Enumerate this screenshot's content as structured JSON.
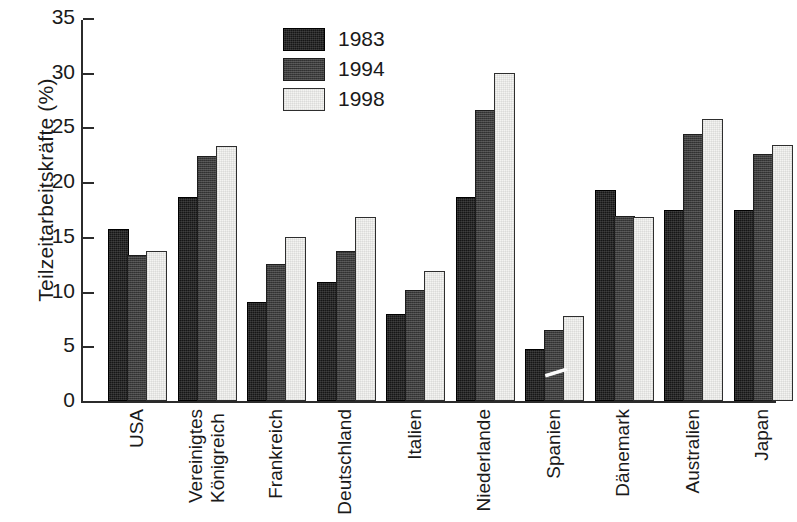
{
  "chart_data": {
    "type": "bar",
    "title": "",
    "xlabel": "",
    "ylabel": "Teilzeitarbeitskräfte (%)",
    "ylim": [
      0,
      35
    ],
    "yticks": [
      0,
      5,
      10,
      15,
      20,
      25,
      30,
      35
    ],
    "grid": false,
    "legend_position": "top-center",
    "categories": [
      "USA",
      "Vereinigtes Königreich",
      "Frankreich",
      "Deutschland",
      "Italien",
      "Niederlande",
      "Spanien",
      "Dänemark",
      "Australien",
      "Japan"
    ],
    "category_lines": [
      [
        "USA"
      ],
      [
        "Vereinigtes",
        "Königreich"
      ],
      [
        "Frankreich"
      ],
      [
        "Deutschland"
      ],
      [
        "Italien"
      ],
      [
        "Niederlande"
      ],
      [
        "Spanien"
      ],
      [
        "Dänemark"
      ],
      [
        "Australien"
      ],
      [
        "Japan"
      ]
    ],
    "series": [
      {
        "name": "1983",
        "color": "#161616",
        "values": [
          15.5,
          18.5,
          8.9,
          10.7,
          7.8,
          18.5,
          4.6,
          19.1,
          17.3,
          17.3
        ]
      },
      {
        "name": "1994",
        "color": "#3c3c3c",
        "values": [
          13.2,
          22.2,
          12.3,
          13.5,
          10.0,
          26.4,
          6.3,
          16.7,
          24.2,
          22.4
        ]
      },
      {
        "name": "1998",
        "color": "#f4f4f2",
        "values": [
          13.5,
          23.1,
          14.8,
          16.6,
          11.7,
          29.8,
          7.6,
          16.6,
          25.6,
          23.2
        ]
      }
    ]
  },
  "legend": {
    "entries": [
      "1983",
      "1994",
      "1998"
    ]
  },
  "axis": {
    "tick_labels": [
      "35",
      "30",
      "25",
      "20",
      "15",
      "10",
      "5",
      "0"
    ]
  }
}
